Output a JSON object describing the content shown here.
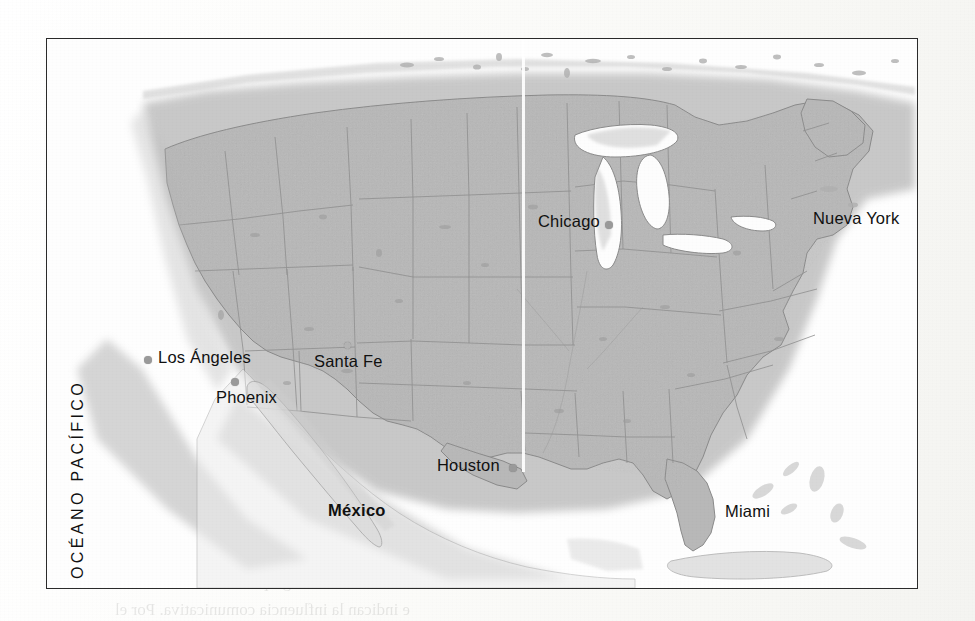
{
  "page": {
    "background_color": "#fdfdfb",
    "kind": "scanned-textbook-page"
  },
  "map": {
    "frame": {
      "x": 46,
      "y": 38,
      "width": 872,
      "height": 551,
      "border_color": "#2b2b2b"
    },
    "land_color": "#b8b8b8",
    "ocean_color": "#fefefe",
    "border_line_color": "#8d8d8d",
    "region": "Estados Unidos de América",
    "ocean_label": "OCÉANO PACÍFICO",
    "country_labels": [
      {
        "name": "México",
        "x": 327,
        "y": 500
      }
    ],
    "cities": [
      {
        "name": "Chicago",
        "label_x": 537,
        "label_y": 211,
        "dot_x": 604,
        "dot_y": 220,
        "dot_style": "solid"
      },
      {
        "name": "Nueva York",
        "label_x": 812,
        "label_y": 208,
        "dot_x": 0,
        "dot_y": 0,
        "dot_style": "none"
      },
      {
        "name": "Los Ángeles",
        "label_x": 157,
        "label_y": 347,
        "dot_x": 143,
        "dot_y": 355,
        "dot_style": "solid"
      },
      {
        "name": "Phoenix",
        "label_x": 215,
        "label_y": 387,
        "dot_x": 230,
        "dot_y": 377,
        "dot_style": "solid"
      },
      {
        "name": "Santa Fe",
        "label_x": 313,
        "label_y": 351,
        "dot_x": 343,
        "dot_y": 341,
        "dot_style": "faint"
      },
      {
        "name": "Houston",
        "label_x": 436,
        "label_y": 455,
        "dot_x": 508,
        "dot_y": 463,
        "dot_style": "solid"
      },
      {
        "name": "Miami",
        "label_x": 724,
        "label_y": 501,
        "dot_x": 0,
        "dot_y": 0,
        "dot_style": "none"
      }
    ]
  },
  "artifacts": {
    "scanline": {
      "x": 521,
      "y": 39,
      "width": 3,
      "height": 432,
      "color": "#ffffff"
    }
  },
  "showthrough_text": [
    {
      "text": "lo que",
      "x": 756,
      "y": 248,
      "size": 17
    },
    {
      "text": "el",
      "x": 790,
      "y": 278,
      "size": 17
    },
    {
      "text": "un",
      "x": 786,
      "y": 308,
      "size": 17
    },
    {
      "text": "arcada",
      "x": 742,
      "y": 338,
      "size": 17
    },
    {
      "text": "yo habla",
      "x": 727,
      "y": 368,
      "size": 17
    },
    {
      "text": "término",
      "x": 735,
      "y": 398,
      "size": 17
    },
    {
      "text": "hispanos",
      "x": 731,
      "y": 428,
      "size": 17
    },
    {
      "text": "es a",
      "x": 560,
      "y": 468,
      "size": 17
    },
    {
      "text": "es de Centroamér",
      "x": 345,
      "y": 494,
      "size": 17
    },
    {
      "text": "de vista de la vida, los hispanos",
      "x": 200,
      "y": 551,
      "size": 17
    },
    {
      "text": "tradicional de otros grupos",
      "x": 245,
      "y": 572,
      "size": 17
    },
    {
      "text": "e indican la influencia comunicativa. Por el",
      "x": 115,
      "y": 600,
      "size": 17
    }
  ]
}
